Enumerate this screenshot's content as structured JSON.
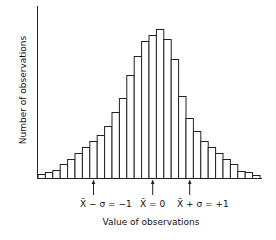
{
  "chart_data": {
    "type": "bar",
    "title": "",
    "xlabel": "Value of observations",
    "ylabel": "Number of observations",
    "grid": false,
    "legend": null,
    "bar_style": "histogram, unfilled outlines",
    "bin_count": 30,
    "values": [
      4,
      6,
      8,
      14,
      19,
      25,
      31,
      37,
      43,
      52,
      66,
      80,
      103,
      122,
      137,
      143,
      149,
      139,
      119,
      82,
      60,
      47,
      37,
      31,
      25,
      19,
      14,
      7,
      6,
      3
    ],
    "annotations": [
      {
        "label_main": "X̄",
        "label_rest": " − σ = −1",
        "bin_position": 7.5
      },
      {
        "label_main": "X̄",
        "label_rest": " = 0",
        "bin_position": 15.5
      },
      {
        "label_main": "X̄",
        "label_rest": " + σ = +1",
        "bin_position": 20.5
      }
    ]
  },
  "labels": {
    "xlabel": "Value of observations",
    "ylabel": "Number of observations",
    "marker_minus": "X̄ − σ = −1",
    "marker_zero": "X̄ = 0",
    "marker_plus": "X̄ + σ = +1"
  }
}
